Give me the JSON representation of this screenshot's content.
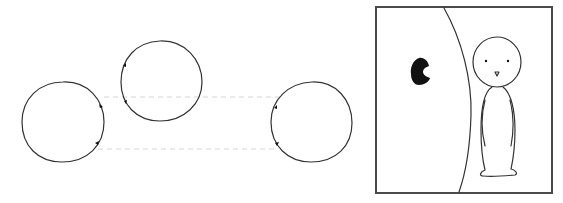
{
  "diagram": {
    "colors": {
      "line": "#333333",
      "dashed": "#d6d6d6",
      "frame": "#4a4a4a",
      "ink": "#111111",
      "background": "#ffffff"
    },
    "loops": [
      {
        "id": "loop-left",
        "cx": 63,
        "cy": 122,
        "rx": 41,
        "ry": 40,
        "markers": [
          "upper-right",
          "lower-right"
        ]
      },
      {
        "id": "loop-middle",
        "cx": 161,
        "cy": 81,
        "rx": 41,
        "ry": 40,
        "markers": [
          "upper-left",
          "lower-left"
        ]
      },
      {
        "id": "loop-right",
        "cx": 311,
        "cy": 122,
        "rx": 41,
        "ry": 40,
        "markers": [
          "upper-left",
          "lower-left"
        ]
      }
    ],
    "connectors": [
      {
        "id": "connector-upper",
        "style": "dashed",
        "y": 97
      },
      {
        "id": "connector-lower",
        "style": "dashed",
        "y": 149
      }
    ],
    "panel": {
      "frame": {
        "x": 376,
        "y": 7,
        "width": 176,
        "height": 186
      },
      "elements": [
        "large-curved-wall",
        "black-blob",
        "stick-figure"
      ]
    }
  }
}
